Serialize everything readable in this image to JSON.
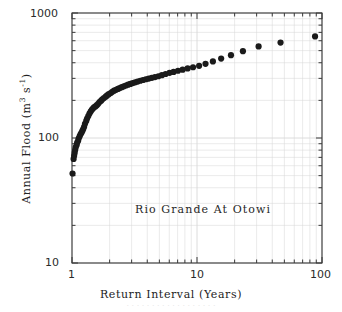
{
  "chart_data": {
    "type": "scatter",
    "title": "",
    "annotation": "Rio Grande At Otowi",
    "xlabel": "Return Interval (Years)",
    "ylabel_text": "Annual Flood (m",
    "ylabel_sup1": "3",
    "ylabel_mid": " s",
    "ylabel_sup2": "-1",
    "ylabel_end": ")",
    "ylabel_plain": "Annual Flood (m3 s-1)",
    "xscale": "log",
    "yscale": "log",
    "xlim": [
      1,
      100
    ],
    "ylim": [
      10,
      1000
    ],
    "grid": true,
    "legend": "none",
    "marker": "filled-circle",
    "marker_color": "#1a1a1a",
    "marker_size_px": 3.1,
    "xticks": [
      1,
      10,
      100
    ],
    "xtick_labels": [
      "1",
      "10",
      "100"
    ],
    "yticks": [
      10,
      100,
      1000
    ],
    "ytick_labels": [
      "10",
      "100",
      "1000"
    ],
    "x": [
      1.01,
      1.03,
      1.04,
      1.05,
      1.06,
      1.07,
      1.09,
      1.1,
      1.12,
      1.13,
      1.15,
      1.17,
      1.19,
      1.21,
      1.23,
      1.25,
      1.27,
      1.3,
      1.32,
      1.35,
      1.38,
      1.41,
      1.44,
      1.47,
      1.5,
      1.54,
      1.58,
      1.62,
      1.66,
      1.71,
      1.75,
      1.8,
      1.86,
      1.91,
      1.97,
      2.04,
      2.1,
      2.17,
      2.25,
      2.33,
      2.41,
      2.5,
      2.6,
      2.7,
      2.81,
      2.93,
      3.06,
      3.2,
      3.35,
      3.52,
      3.7,
      3.9,
      4.11,
      4.35,
      4.61,
      4.91,
      5.24,
      5.61,
      6.03,
      6.5,
      7.05,
      7.68,
      8.42,
      9.3,
      10.4,
      11.7,
      13.4,
      15.6,
      18.7,
      23.3,
      31.1,
      46.6,
      88.0
    ],
    "y": [
      52,
      68,
      72,
      76,
      80,
      84,
      88,
      92,
      95,
      99,
      103,
      107,
      110,
      114,
      118,
      123,
      130,
      137,
      143,
      150,
      157,
      163,
      168,
      172,
      176,
      179,
      183,
      188,
      194,
      199,
      204,
      209,
      214,
      219,
      224,
      229,
      234,
      239,
      243,
      247,
      251,
      255,
      259,
      263,
      267,
      271,
      275,
      279,
      283,
      287,
      291,
      295,
      299,
      303,
      307,
      312,
      318,
      325,
      332,
      338,
      345,
      352,
      360,
      368,
      378,
      392,
      410,
      432,
      460,
      495,
      540,
      580,
      650
    ],
    "n_points": 73
  },
  "axes": {
    "x_axis_title": "Return Interval (Years)",
    "y_axis_title": "Annual Flood (m3 s-1)",
    "x_tick_1": "1",
    "x_tick_10": "10",
    "x_tick_100": "100",
    "y_tick_10": "10",
    "y_tick_100": "100",
    "y_tick_1000": "1000"
  },
  "annotation": {
    "text": "Rio Grande At Otowi"
  },
  "bottom_ghost": {
    "text": "· · · · · · · · · · · · · · · · · ·"
  },
  "colors": {
    "background": "#ffffff",
    "axis": "#3a3a3a",
    "grid": "#d8d8d8",
    "marker": "#1a1a1a",
    "text": "#222222"
  }
}
